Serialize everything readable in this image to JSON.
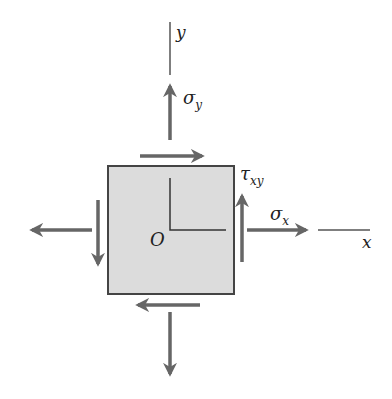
{
  "diagram": {
    "labels": {
      "y_axis": "y",
      "x_axis": "x",
      "origin": "O",
      "sigma_y": "σ",
      "sigma_y_sub": "y",
      "sigma_x": "σ",
      "sigma_x_sub": "x",
      "tau_xy": "τ",
      "tau_xy_sub": "xy"
    },
    "colors": {
      "element_fill": "#dcdcdc",
      "element_stroke": "#444444",
      "arrow": "#666666",
      "axis": "#333333"
    }
  }
}
